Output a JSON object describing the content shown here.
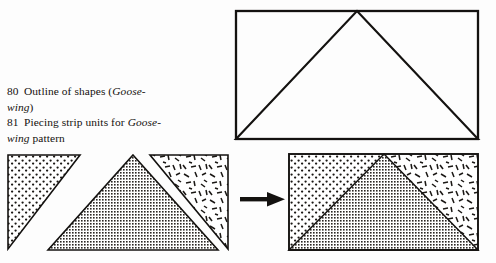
{
  "page": {
    "background_color": "#fdfdfd",
    "ink_color": "#141210"
  },
  "caption": {
    "entries": [
      {
        "number": "80",
        "segments": [
          {
            "text": "Outline of shapes (",
            "style": "roman"
          },
          {
            "text": "Goose-",
            "style": "italic"
          },
          {
            "text": "wing",
            "style": "italic"
          },
          {
            "text": ")",
            "style": "roman"
          }
        ],
        "line1_plain": "Outline of shapes (Goose-",
        "line2_plain": "wing)"
      },
      {
        "number": "81",
        "segments": [
          {
            "text": "Piecing strip units for ",
            "style": "roman"
          },
          {
            "text": "Goose-",
            "style": "italic"
          },
          {
            "text": "wing",
            "style": "italic"
          },
          {
            "text": " pattern",
            "style": "roman"
          }
        ],
        "line1_plain": "Piecing strip units for Goose-",
        "line2_plain": "wing pattern"
      }
    ],
    "line_80_a_pre": "Outline of shapes (",
    "line_80_a_ital": "Goose-",
    "line_80_b_ital": "wing",
    "line_80_b_post": ")",
    "line_81_a_pre": "Piecing strip units for ",
    "line_81_a_ital": "Goose-",
    "line_81_b_ital": "wing",
    "line_81_b_post": " pattern",
    "num_80": "80",
    "num_81": "81"
  },
  "figures": {
    "outline": {
      "name": "outline-of-shapes",
      "description": "Rectangle with inscribed triangle, apex at top center",
      "rect": {
        "x": 8,
        "y": 9,
        "w": 242,
        "h": 128
      },
      "triangle_points": "129,9 250,137 8,137",
      "stroke": "#141210",
      "stroke_width": 2.2,
      "fill": "none"
    },
    "units": {
      "name": "piecing-strip-units",
      "description": "Three separated patchwork pieces before joining",
      "pieces": [
        {
          "name": "left-dotted-triangle",
          "fill": "dots",
          "points": "8,10 80,10 8,104"
        },
        {
          "name": "center-crosshatch-triangle",
          "fill": "crosshatch",
          "points": "133,10 218,105 48,105"
        },
        {
          "name": "right-dashed-triangle",
          "fill": "dashes",
          "points": "150,10 228,10 228,104"
        }
      ]
    },
    "arrow": {
      "name": "process-arrow",
      "direction": "right",
      "color": "#141210",
      "shaft": {
        "x": 0,
        "y": 7,
        "w": 30,
        "h": 4
      },
      "head_points": "28,2 45,9 28,16"
    },
    "assembled": {
      "name": "assembled-block",
      "description": "Three pieces sewn into one rectangular block",
      "rect": {
        "x": 6,
        "y": 9,
        "w": 189,
        "h": 96
      },
      "pieces": [
        {
          "name": "left-dotted-region",
          "fill": "dots",
          "points": "6,9 101,9 6,105"
        },
        {
          "name": "center-crosshatch-triangle",
          "fill": "crosshatch",
          "points": "101,9 195,105 6,105"
        },
        {
          "name": "right-dashed-region",
          "fill": "dashes",
          "points": "101,9 195,9 195,105"
        }
      ],
      "stroke": "#141210",
      "stroke_width": 1.8
    }
  },
  "textures": {
    "dots": {
      "label": "stippled-dots",
      "color": "#1a1714"
    },
    "crosshatch": {
      "label": "dense-grid-crosshatch",
      "color": "#2b2724"
    },
    "dashes": {
      "label": "scattered-short-dashes",
      "color": "#1a1714"
    }
  }
}
